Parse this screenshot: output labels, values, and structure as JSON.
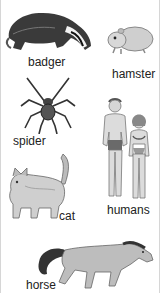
{
  "figure": {
    "animals": [
      {
        "label": "badger"
      },
      {
        "label": "hamster"
      },
      {
        "label": "spider"
      },
      {
        "label": "humans"
      },
      {
        "label": "cat"
      },
      {
        "label": "horse"
      }
    ]
  }
}
